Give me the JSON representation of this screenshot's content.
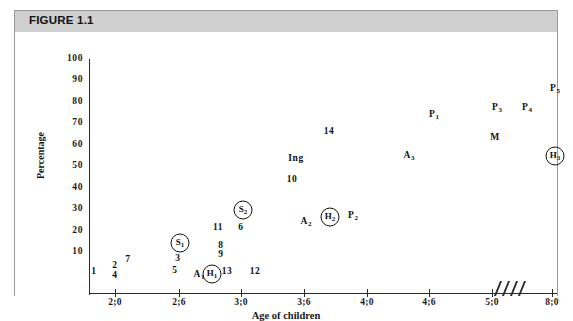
{
  "figure": {
    "header_label": "FIGURE 1.1"
  },
  "chart_data": {
    "type": "scatter",
    "title": "FIGURE 1.1",
    "xlabel": "Age of children",
    "ylabel": "Percentage",
    "ylim": [
      0,
      100
    ],
    "y_ticks": [
      100,
      90,
      80,
      70,
      60,
      50,
      40,
      30,
      20,
      10
    ],
    "x_ticks": [
      "2;0",
      "2;6",
      "3;0",
      "3;6",
      "4;0",
      "4;6",
      "5;0",
      "8;0"
    ],
    "axis_break": {
      "between": [
        "5;0",
        "8;0"
      ],
      "glyph": "////"
    },
    "grid": false,
    "legend": "none",
    "points": [
      {
        "label": "1",
        "x": "2;0",
        "y": 7,
        "circled": false
      },
      {
        "label": "2",
        "x": "2;0",
        "y": 10,
        "circled": false
      },
      {
        "label": "4",
        "x": "2;0",
        "y": 7,
        "circled": false
      },
      {
        "label": "7",
        "x": "2;1",
        "y": 13,
        "circled": false
      },
      {
        "label": "5",
        "x": "2;5",
        "y": 8,
        "circled": false
      },
      {
        "label": "3",
        "x": "2;6",
        "y": 17,
        "circled": false
      },
      {
        "label": "S1",
        "x": "2;6",
        "y": 23,
        "circled": true
      },
      {
        "label": "A1",
        "x": "2;8",
        "y": 7,
        "circled": false
      },
      {
        "label": "H1",
        "x": "2;9",
        "y": 7,
        "circled": true
      },
      {
        "label": "13",
        "x": "2;10",
        "y": 8,
        "circled": false
      },
      {
        "label": "9",
        "x": "2;9",
        "y": 21,
        "circled": false
      },
      {
        "label": "8",
        "x": "2;9",
        "y": 25,
        "circled": false
      },
      {
        "label": "11",
        "x": "2;9",
        "y": 33,
        "circled": false
      },
      {
        "label": "6",
        "x": "2;11",
        "y": 33,
        "circled": false
      },
      {
        "label": "S2",
        "x": "2;11",
        "y": 40,
        "circled": true
      },
      {
        "label": "12",
        "x": "3;2",
        "y": 8,
        "circled": false
      },
      {
        "label": "A2",
        "x": "3;6",
        "y": 34,
        "circled": false
      },
      {
        "label": "H2",
        "x": "3;9",
        "y": 36,
        "circled": true
      },
      {
        "label": "P2",
        "x": "3;10",
        "y": 37,
        "circled": false
      },
      {
        "label": "10",
        "x": "3;4",
        "y": 52,
        "circled": false
      },
      {
        "label": "Ing",
        "x": "3;4",
        "y": 62,
        "circled": false
      },
      {
        "label": "14",
        "x": "3;6",
        "y": 75,
        "circled": false
      },
      {
        "label": "A3",
        "x": "4;2",
        "y": 63,
        "circled": false
      },
      {
        "label": "P1",
        "x": "4;6",
        "y": 85,
        "circled": false
      },
      {
        "label": "M",
        "x": "5;0",
        "y": 75,
        "circled": false
      },
      {
        "label": "P3",
        "x": "5;0",
        "y": 85,
        "circled": false
      },
      {
        "label": "P4",
        "x": "5;4",
        "y": 85,
        "circled": false
      },
      {
        "label": "P5",
        "x": "8;0",
        "y": 95,
        "circled": false
      },
      {
        "label": "H3",
        "x": "8;0",
        "y": 65,
        "circled": true
      }
    ]
  },
  "layout": {
    "y_tick_px": {
      "100": 27,
      "90": 48,
      "80": 70,
      "70": 91,
      "60": 113,
      "50": 134,
      "40": 156,
      "30": 177,
      "20": 199,
      "10": 220
    },
    "x_tick_px": {
      "2;0": 100,
      "2;6": 164,
      "3;0": 226,
      "3;6": 289,
      "4;0": 352,
      "4;6": 414,
      "5;0": 477,
      "8;0": 537
    },
    "point_px": [
      {
        "label": "1",
        "left": 79,
        "top": 239
      },
      {
        "label": "2",
        "left": 100,
        "top": 233
      },
      {
        "label": "4",
        "left": 100,
        "top": 243
      },
      {
        "label": "7",
        "left": 113,
        "top": 227
      },
      {
        "label": "5",
        "left": 160,
        "top": 238
      },
      {
        "label": "3",
        "left": 163,
        "top": 226
      },
      {
        "label": "S1",
        "left": 165,
        "top": 211
      },
      {
        "label": "A1",
        "left": 184,
        "top": 243
      },
      {
        "label": "H1",
        "left": 197,
        "top": 242
      },
      {
        "label": "13",
        "left": 212,
        "top": 239
      },
      {
        "label": "9",
        "left": 206,
        "top": 222
      },
      {
        "label": "8",
        "left": 206,
        "top": 213
      },
      {
        "label": "11",
        "left": 203,
        "top": 195
      },
      {
        "label": "6",
        "left": 226,
        "top": 195
      },
      {
        "label": "S2",
        "left": 228,
        "top": 178
      },
      {
        "label": "12",
        "left": 240,
        "top": 239
      },
      {
        "label": "A2",
        "left": 291,
        "top": 190
      },
      {
        "label": "H2",
        "left": 315,
        "top": 185
      },
      {
        "label": "P2",
        "left": 338,
        "top": 184
      },
      {
        "label": "10",
        "left": 277,
        "top": 147
      },
      {
        "label": "Ing",
        "left": 281,
        "top": 126
      },
      {
        "label": "14",
        "left": 314,
        "top": 99
      },
      {
        "label": "A3",
        "left": 394,
        "top": 124
      },
      {
        "label": "P1",
        "left": 419,
        "top": 83
      },
      {
        "label": "M",
        "left": 480,
        "top": 105
      },
      {
        "label": "P3",
        "left": 482,
        "top": 76
      },
      {
        "label": "P4",
        "left": 512,
        "top": 76
      },
      {
        "label": "P5",
        "left": 540,
        "top": 57
      },
      {
        "label": "H3",
        "left": 540,
        "top": 124
      }
    ]
  }
}
